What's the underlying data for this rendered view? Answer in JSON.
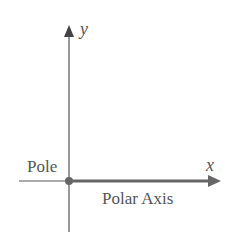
{
  "diagram": {
    "axes": {
      "y_label": "y",
      "x_label": "x"
    },
    "labels": {
      "pole": "Pole",
      "polar_axis": "Polar Axis"
    },
    "colors": {
      "axis": "#555555",
      "polar_axis": "#666666",
      "pole_dot": "#666666",
      "text": "#555555"
    }
  }
}
